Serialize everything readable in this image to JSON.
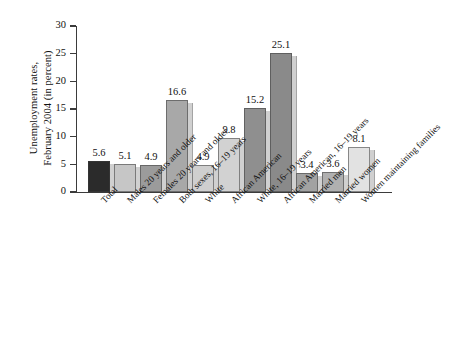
{
  "chart_data": {
    "type": "bar",
    "title": "",
    "xlabel": "",
    "ylabel": "Unemployment rates, February 2004 (in percent)",
    "ylabel_lines": [
      "Unemployment rates,",
      "February 2004 (in percent)"
    ],
    "ylim": [
      0,
      30
    ],
    "yticks": [
      0,
      5,
      10,
      15,
      20,
      25,
      30
    ],
    "ytick_labels": [
      "0",
      "5",
      "10",
      "15",
      "20",
      "25",
      "30"
    ],
    "grid": false,
    "legend": "none",
    "categories": [
      "Total",
      "Males 20 years and older",
      "Females 20 years and older",
      "Both sexes, 16–19 years",
      "White",
      "African American",
      "White, 16–19 years",
      "African American, 16–19 years",
      "Married men",
      "Married women",
      "Women maintaining families"
    ],
    "values": [
      5.6,
      5.1,
      4.9,
      16.6,
      4.9,
      9.8,
      15.2,
      25.1,
      3.4,
      3.6,
      8.1
    ],
    "value_labels": [
      "5.6",
      "5.1",
      "4.9",
      "16.6",
      "4.9",
      "9.8",
      "15.2",
      "25.1",
      "3.4",
      "3.6",
      "8.1"
    ],
    "bar_colors": [
      "#2b2b2b",
      "#c6c6c6",
      "#9b9b9b",
      "#a8a8a8",
      "#cfcfcf",
      "#d2d2d2",
      "#8f8f8f",
      "#8a8a8a",
      "#a2a2a2",
      "#b0b0b0",
      "#e2e2e2"
    ]
  }
}
